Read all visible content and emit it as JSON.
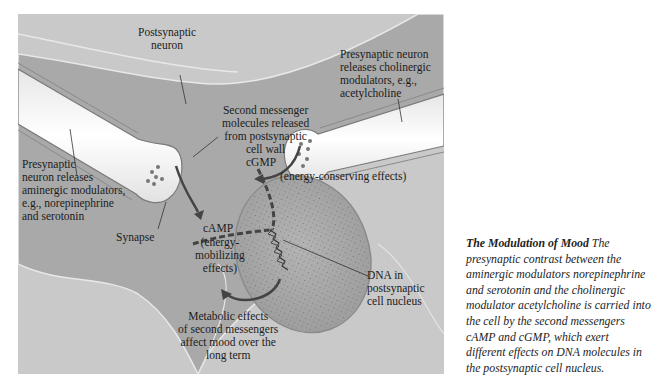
{
  "figure": {
    "labels": {
      "postsynaptic_neuron": [
        "Postsynaptic",
        "neuron"
      ],
      "presynaptic_cholinergic": [
        "Presynaptic neuron",
        "releases cholinergic",
        "modulators, e.g.,",
        "acetylcholine"
      ],
      "second_messenger": [
        "Second messenger",
        "molecules released",
        "from postsynaptic",
        "cell wall"
      ],
      "presynaptic_aminergic": [
        "Presynaptic",
        "neuron releases",
        "aminergic modulators,",
        "e.g., norepinephrine",
        "and serotonin"
      ],
      "cgmp": "cGMP",
      "cgmp_effects": "(energy-conserving effects)",
      "camp": "cAMP",
      "camp_effects": [
        "(energy-",
        "mobilizing",
        "effects)"
      ],
      "synapse": "Synapse",
      "dna": [
        "DNA in",
        "postsynaptic",
        "cell nucleus"
      ],
      "metabolic": [
        "Metabolic effects",
        "of second messengers",
        "affect mood over the",
        "long term"
      ]
    },
    "colors": {
      "background": "#c9c9c9",
      "neuron_body": "#a9a9a9",
      "axon": "#f4f4f4",
      "nucleus": "#a6a6a6",
      "arrow": "#444444"
    }
  },
  "caption": {
    "title": "The Modulation of Mood",
    "lines": [
      "The",
      "presynaptic contrast between the",
      "aminergic modulators norepinephrine",
      "and serotonin and the cholinergic",
      "modulator acetylcholine is carried into",
      "the cell by the second messengers",
      "cAMP and cGMP, which exert",
      "different effects on DNA molecules in",
      "the postsynaptic cell nucleus."
    ]
  }
}
